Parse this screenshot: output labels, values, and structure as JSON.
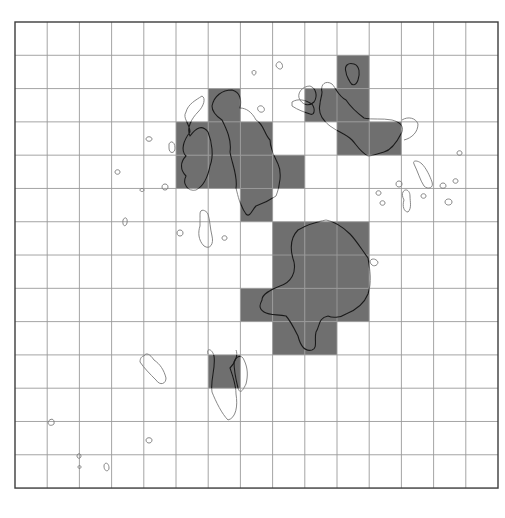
{
  "map": {
    "title": "Grid distribution map",
    "grid": {
      "origin_x": 15,
      "origin_y": 22,
      "cols": 15,
      "rows": 14,
      "cell_w": 32.2,
      "cell_h": 33.29,
      "line_color": "#9a9a9a",
      "frame_color": "#3c3c3c"
    },
    "colors": {
      "shaded_fill": "#6f6f6f",
      "outline_light": "#7a7a7a",
      "outline_dark": "#1a1a1a",
      "background": "#ffffff"
    },
    "shaded_cells": [
      {
        "row": 1,
        "col": 10
      },
      {
        "row": 2,
        "col": 6
      },
      {
        "row": 2,
        "col": 9
      },
      {
        "row": 2,
        "col": 10
      },
      {
        "row": 3,
        "col": 5
      },
      {
        "row": 3,
        "col": 6
      },
      {
        "row": 3,
        "col": 7
      },
      {
        "row": 3,
        "col": 10
      },
      {
        "row": 3,
        "col": 11
      },
      {
        "row": 4,
        "col": 5
      },
      {
        "row": 4,
        "col": 6
      },
      {
        "row": 4,
        "col": 7
      },
      {
        "row": 4,
        "col": 8
      },
      {
        "row": 5,
        "col": 7
      },
      {
        "row": 6,
        "col": 8
      },
      {
        "row": 6,
        "col": 9
      },
      {
        "row": 6,
        "col": 10
      },
      {
        "row": 7,
        "col": 8
      },
      {
        "row": 7,
        "col": 9
      },
      {
        "row": 7,
        "col": 10
      },
      {
        "row": 8,
        "col": 7
      },
      {
        "row": 8,
        "col": 8
      },
      {
        "row": 8,
        "col": 9
      },
      {
        "row": 8,
        "col": 10
      },
      {
        "row": 9,
        "col": 8
      },
      {
        "row": 9,
        "col": 9
      },
      {
        "row": 10,
        "col": 6
      }
    ],
    "island_outlines": [
      {
        "name": "large-west-island",
        "d": "M190,136 C186,128 192,118 198,112 C204,106 206,98 202,96 C196,100 188,104 186,112 C182,118 190,124 190,132 C184,140 180,150 186,156 C180,162 180,170 186,176 C182,184 188,192 196,190 C204,186 208,176 210,166 C214,156 212,142 208,132 C202,124 196,128 190,136 Z"
      },
      {
        "name": "large-central-island",
        "d": "M212,106 C214,96 222,90 232,90 C240,92 242,100 240,108 C246,108 252,112 256,120 C264,124 264,134 270,140 C270,148 274,156 278,164 C282,172 280,186 276,196 C270,200 262,204 256,206 C252,210 250,218 246,214 C240,206 238,196 236,188 C238,176 232,164 230,152 C232,140 226,128 222,120 C216,116 212,112 212,106 Z"
      },
      {
        "name": "north-east-island",
        "d": "M322,92 C320,84 326,80 332,84 C336,88 338,96 346,100 C350,106 356,112 364,118 C372,120 382,118 392,120 C400,122 404,126 402,132 C398,140 392,150 384,152 C376,154 372,156 368,156 C360,152 356,144 352,140 C346,134 338,132 330,126 C322,120 318,112 320,104 C320,100 322,96 322,92 Z"
      },
      {
        "name": "north-tip-island",
        "d": "M346,72 C344,66 348,62 354,64 C360,66 360,74 358,80 C356,86 352,86 350,82 C348,78 346,76 346,72 Z"
      },
      {
        "name": "north-islet-a",
        "d": "M300,100 C296,94 302,86 310,86 C316,88 318,96 314,102 C310,106 304,106 300,100 Z"
      },
      {
        "name": "north-islet-b",
        "d": "M276,66 C276,62 280,60 282,64 C284,68 280,72 276,66 Z"
      },
      {
        "name": "north-islet-c",
        "d": "M252,72 C252,70 256,70 256,72 C256,76 252,76 252,72 Z"
      },
      {
        "name": "north-islet-d",
        "d": "M258,110 C256,106 262,104 264,108 C266,112 260,114 258,110 Z"
      },
      {
        "name": "east-channel-islet",
        "d": "M292,102 C298,98 306,100 312,104 C316,110 314,116 310,114 C304,112 298,110 292,106 Z"
      },
      {
        "name": "central-south-island",
        "d": "M262,300 C262,294 270,290 280,286 C292,282 296,272 294,262 C290,250 290,238 298,230 C308,224 316,222 326,220 C336,222 344,228 350,234 C356,240 362,250 368,258 C370,270 372,282 368,294 C364,304 356,310 346,314 C340,318 332,318 328,316 C318,318 320,326 316,332 C314,340 318,348 312,350 C304,352 300,344 298,336 C294,328 290,320 286,316 C278,314 270,316 264,312 C258,308 260,304 262,300 Z"
      },
      {
        "name": "central-south-east-islet",
        "d": "M370,262 C370,258 376,258 378,262 C378,266 372,268 370,262 Z"
      },
      {
        "name": "south-west-island",
        "d": "M208,354 C206,348 212,348 214,356 C216,368 210,380 212,392 C216,402 222,414 228,420 C236,418 238,406 236,394 C236,384 232,374 230,368 C236,362 238,354 236,350"
      },
      {
        "name": "south-west-island-east",
        "d": "M234,362 C236,356 242,354 244,360 C248,368 248,376 246,384 C242,392 240,394 238,388 C236,380 234,370 234,362 Z"
      },
      {
        "name": "south-west-peninsula",
        "d": "M144,356 C146,352 150,354 154,360 C160,364 164,370 166,378 C166,384 160,386 156,380 C150,374 144,368 140,362 C140,358 142,356 144,356 Z"
      },
      {
        "name": "west-islet-1",
        "d": "M146,139 C146,136 152,136 152,139 C152,142 146,142 146,139 Z"
      },
      {
        "name": "west-islet-2",
        "d": "M169,144 C171,140 175,142 175,148 C175,154 169,154 169,148 Z"
      },
      {
        "name": "west-islet-3",
        "d": "M115,172 C115,169 120,169 120,172 C120,175 115,175 115,172 Z"
      },
      {
        "name": "west-islet-4",
        "d": "M140,190 C140,188 144,188 144,190 C144,192 140,192 140,190 Z"
      },
      {
        "name": "west-islet-5",
        "d": "M162,187 C162,183 168,183 168,187 C168,191 162,191 162,187 Z"
      },
      {
        "name": "west-islet-6",
        "d": "M123,220 C125,216 128,218 127,223 C126,227 122,227 123,220 Z"
      },
      {
        "name": "west-islet-7",
        "d": "M177,233 C177,229 183,229 183,233 C183,237 177,237 177,233 Z"
      },
      {
        "name": "west-elongated-islet",
        "d": "M200,214 C200,208 206,210 208,214 C210,220 210,228 212,236 C214,244 210,250 204,246 C198,240 198,232 200,226 C200,220 200,216 200,214 Z"
      },
      {
        "name": "west-islet-8",
        "d": "M222,238 C222,235 227,235 227,238 C227,241 222,241 222,238 Z"
      },
      {
        "name": "east-islet-1",
        "d": "M457,153 C457,150 462,150 462,153 C462,156 457,156 457,153 Z"
      },
      {
        "name": "east-elongated-islet",
        "d": "M414,164 C412,160 418,160 422,164 C426,168 430,176 432,182 C434,188 428,190 424,186 C420,180 418,172 414,164 Z"
      },
      {
        "name": "east-islet-2",
        "d": "M440,186 C440,182 446,182 446,186 C446,189 440,189 440,186 Z"
      },
      {
        "name": "east-islet-3",
        "d": "M453,181 C453,178 458,178 458,181 C458,184 453,184 453,181 Z"
      },
      {
        "name": "east-islet-4",
        "d": "M396,184 C396,180 402,180 402,184 C402,188 396,188 396,184 Z"
      },
      {
        "name": "east-tall-islet",
        "d": "M403,192 C405,188 410,190 410,196 C410,202 412,208 408,212 C404,212 402,206 404,200 C402,196 402,194 403,192 Z"
      },
      {
        "name": "east-islet-5",
        "d": "M376,193 C376,190 381,190 381,193 C381,196 376,196 376,193 Z"
      },
      {
        "name": "east-islet-6",
        "d": "M380,203 C380,200 385,200 385,203 C385,206 380,206 380,203 Z"
      },
      {
        "name": "east-islet-7",
        "d": "M421,196 C421,193 426,193 426,196 C426,199 421,199 421,196 Z"
      },
      {
        "name": "east-islet-8",
        "d": "M445,202 C445,198 452,198 452,202 C452,206 445,206 445,202 Z"
      },
      {
        "name": "east-coast-bulge",
        "d": "M402,120 C408,116 416,118 418,124 C418,132 412,138 404,140"
      },
      {
        "name": "south-islet-1",
        "d": "M48,422 C50,418 55,418 54,424 C52,426 48,426 48,422 Z"
      },
      {
        "name": "south-islet-2",
        "d": "M77,456 C77,453 81,453 81,456 C81,459 77,459 77,456 Z"
      },
      {
        "name": "south-islet-3",
        "d": "M78,467 C78,465 81,465 81,467 C81,469 78,469 78,467 Z"
      },
      {
        "name": "south-islet-4",
        "d": "M104,466 C104,462 109,462 109,468 C109,472 104,472 104,466 Z"
      },
      {
        "name": "south-islet-5",
        "d": "M146,440 C146,437 152,437 152,440 C152,444 146,444 146,440 Z"
      }
    ]
  }
}
